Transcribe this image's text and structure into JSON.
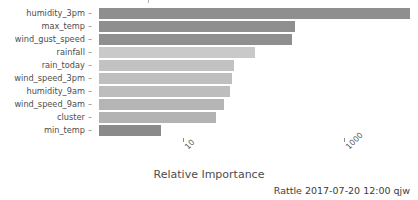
{
  "chart_data": {
    "type": "bar",
    "orientation": "horizontal",
    "title": "",
    "xlabel": "Relative Importance",
    "ylabel": "",
    "xscale": "log",
    "xticks": [
      10,
      1000
    ],
    "xticklabels": [
      "10",
      "1000"
    ],
    "grid": false,
    "legend": false,
    "categories": [
      "humidity_3pm",
      "max_temp",
      "wind_gust_speed",
      "rainfall",
      "rain_today",
      "wind_speed_3pm",
      "humidity_9am",
      "wind_speed_9am",
      "cluster",
      "min_temp"
    ],
    "values": [
      3100,
      275,
      260,
      150,
      97,
      94,
      90,
      82,
      66,
      14
    ],
    "bar_colors": [
      "#8f8f8f",
      "#8f8f8f",
      "#8f8f8f",
      "#c9c9c9",
      "#c2c2c2",
      "#bfbfbf",
      "#bdbdbd",
      "#b5b5b5",
      "#b3b3b3",
      "#8a8a8a"
    ],
    "bar_widths_px": [
      311,
      196,
      193,
      156,
      135,
      133,
      131,
      125,
      117,
      62
    ]
  },
  "axis": {
    "x_title": "Relative Importance",
    "tick_labels": [
      "10",
      "1000"
    ],
    "tick_positions_px": [
      183,
      344
    ]
  },
  "footer": {
    "stamp": "Rattle 2017-07-20 12:00 qjw"
  }
}
